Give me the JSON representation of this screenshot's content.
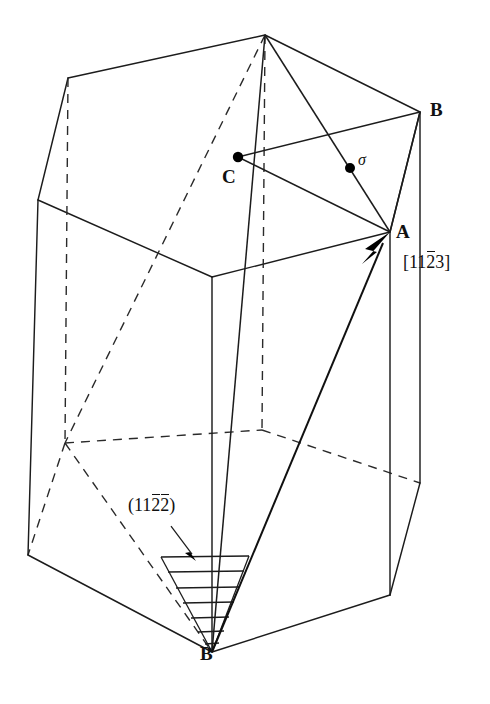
{
  "figure": {
    "kind": "crystallography-diagram",
    "background_color": "#ffffff",
    "line_color": "#1c1c1c"
  },
  "labels": {
    "vertex_a": "A",
    "vertex_b": "B",
    "vertex_c": "C",
    "vertex_b_prime_base": "B",
    "vertex_b_prime_mark": "′",
    "shear_point": "σ"
  },
  "indices": {
    "direction": {
      "open_bracket": "[",
      "d1": "1",
      "d2": "1",
      "d3_overbar": "2",
      "d4": "3",
      "close_bracket": "]",
      "plain_text": "[11-23]"
    },
    "plane": {
      "open_paren": "(",
      "p1": "1",
      "p2": "1",
      "p3_overbar": "2",
      "p4_overbar": "2",
      "close_paren": ")",
      "plain_text": "(11-2-2)"
    }
  },
  "geometry": {
    "top_hexagon": {
      "front_left": [
        68,
        78
      ],
      "left": [
        38,
        200
      ],
      "front_mid": [
        212,
        277
      ],
      "right_front": [
        390,
        232
      ],
      "right_back": [
        420,
        112
      ],
      "top_apex": [
        265,
        35
      ]
    },
    "bottom_hexagon": {
      "front_left": [
        28,
        555
      ],
      "front_mid": [
        212,
        652
      ],
      "right_front": [
        390,
        595
      ],
      "right_back": [
        420,
        483
      ],
      "back_apex": [
        262,
        430
      ],
      "back_left": [
        65,
        443
      ]
    },
    "points": {
      "A": [
        390,
        232
      ],
      "B": [
        420,
        112
      ],
      "C": [
        238,
        157
      ],
      "sigma": [
        350,
        168
      ],
      "B_prime": [
        212,
        652
      ],
      "top_apex": [
        265,
        35
      ]
    },
    "slip_vector": {
      "from": [
        212,
        652
      ],
      "to": [
        390,
        232
      ],
      "arrowhead_at": "A"
    },
    "hatched_region": {
      "apex": [
        212,
        652
      ],
      "left_top": [
        162,
        557
      ],
      "right_top": [
        248,
        556
      ],
      "line_count": 7
    },
    "plane_pointer": {
      "from": [
        175,
        528
      ],
      "to": [
        195,
        558
      ]
    }
  }
}
